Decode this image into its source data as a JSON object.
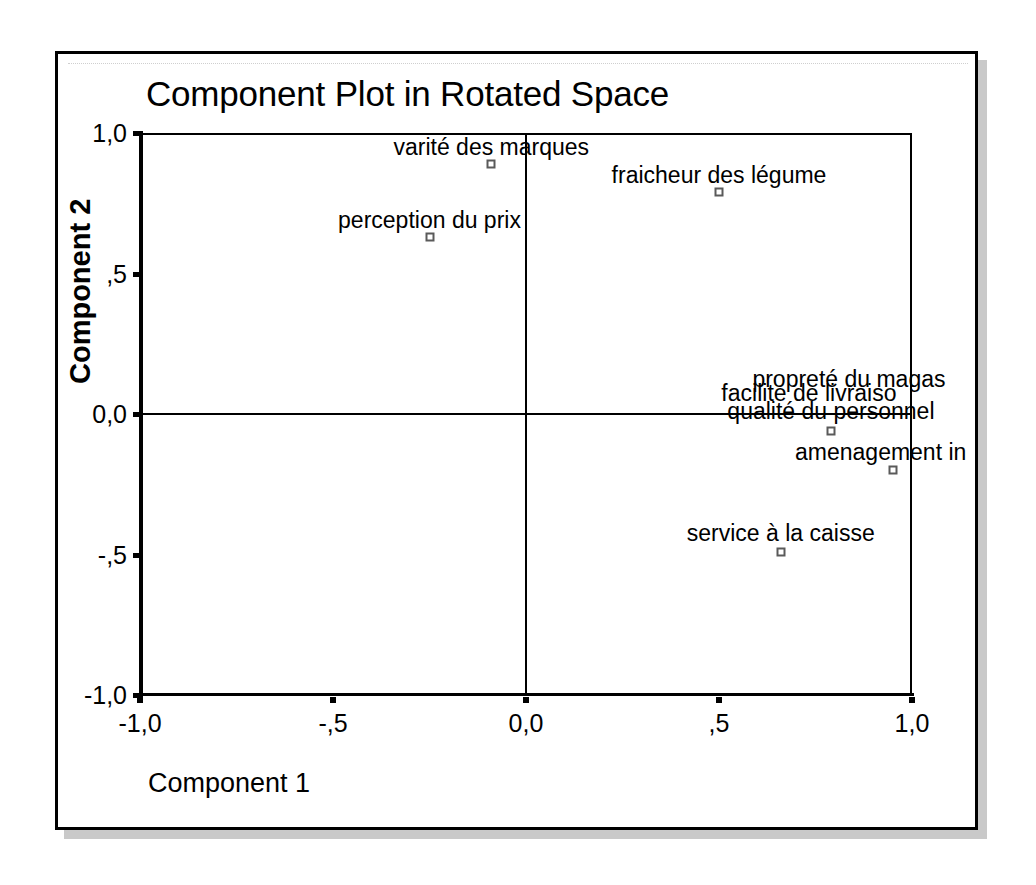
{
  "chart_data": {
    "type": "scatter",
    "title": "Component Plot in Rotated Space",
    "xlabel": "Component 1",
    "ylabel": "Component 2",
    "xlim": [
      -1.0,
      1.0
    ],
    "ylim": [
      -1.0,
      1.0
    ],
    "grid": false,
    "legend": "none",
    "x_ticks": [
      {
        "value": -1.0,
        "label": "-1,0"
      },
      {
        "value": -0.5,
        "label": "-,5"
      },
      {
        "value": 0.0,
        "label": "0,0"
      },
      {
        "value": 0.5,
        "label": ",5"
      },
      {
        "value": 1.0,
        "label": "1,0"
      }
    ],
    "y_ticks": [
      {
        "value": 1.0,
        "label": "1,0"
      },
      {
        "value": 0.5,
        "label": ",5"
      },
      {
        "value": 0.0,
        "label": "0,0"
      },
      {
        "value": -0.5,
        "label": "-,5"
      },
      {
        "value": -1.0,
        "label": "-1,0"
      }
    ],
    "zero_lines": {
      "x": 0.0,
      "y": 0.0
    },
    "points": [
      {
        "label": "varité des marques",
        "x": -0.09,
        "y": 0.89,
        "label_dx": 0,
        "label_dy": -28,
        "clipped": false
      },
      {
        "label": "perception du prix",
        "x": -0.25,
        "y": 0.63,
        "label_dx": 0,
        "label_dy": -28,
        "clipped": false
      },
      {
        "label": "fraicheur des légume",
        "x": 0.5,
        "y": 0.79,
        "label_dx": 0,
        "label_dy": -28,
        "clipped": false
      },
      {
        "label": "propreté du magas",
        "x": 0.79,
        "y": -0.06,
        "label_dx": 18,
        "label_dy": -63,
        "clipped": true
      },
      {
        "label": "facilite de livraiso",
        "x": 0.79,
        "y": -0.06,
        "label_dx": -22,
        "label_dy": -49,
        "clipped": false
      },
      {
        "label": "qualité du personnel",
        "x": 0.79,
        "y": -0.06,
        "label_dx": 0,
        "label_dy": -31,
        "clipped": false
      },
      {
        "label": "amenagement in",
        "x": 0.95,
        "y": -0.2,
        "label_dx": -12,
        "label_dy": -29,
        "clipped": true
      },
      {
        "label": "service à la caisse",
        "x": 0.66,
        "y": -0.49,
        "label_dx": 0,
        "label_dy": -30,
        "clipped": false
      }
    ]
  }
}
